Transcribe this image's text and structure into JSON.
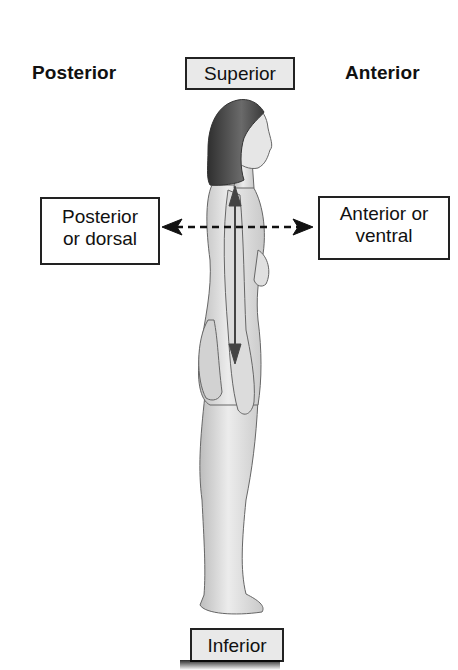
{
  "diagram": {
    "title_left": "Posterior",
    "title_right": "Anterior",
    "labels": {
      "superior": "Superior",
      "inferior": "Inferior",
      "posterior_line1": "Posterior",
      "posterior_line2": "or dorsal",
      "anterior_line1": "Anterior or",
      "anterior_line2": "ventral"
    },
    "arrows": {
      "vertical": "superior-inferior solid double arrow",
      "horizontal": "posterior-anterior dashed double arrow"
    },
    "figure": "standing human figure, lateral (side) view facing right"
  }
}
